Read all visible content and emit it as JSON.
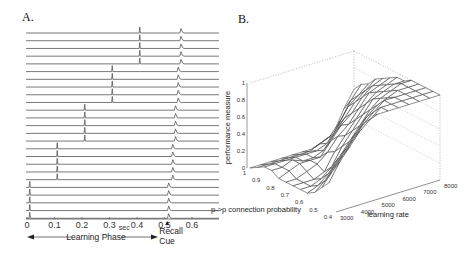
{
  "panels": {
    "a": {
      "label": "A."
    },
    "b": {
      "label": "B."
    }
  },
  "chart_data": [
    {
      "type": "line",
      "title": "A.",
      "description": "Spike raster traces: 25 neurons in 5 groups of 5; each group fires once during learning phase then again after recall cue",
      "xlabel": "sec",
      "xticks": [
        0,
        0.1,
        0.2,
        0.3,
        0.4,
        0.5,
        0.6
      ],
      "xtick_labels": [
        "0",
        "0.1",
        "0.2",
        "0.3",
        "0.4",
        "0.5",
        "0.6"
      ],
      "xlim": [
        0,
        0.7
      ],
      "annotations": {
        "learning_phase": "Learning Phase",
        "recall_cue_line1": "Recall",
        "recall_cue_line2": "Cue",
        "recall_cue_time": 0.51
      },
      "traces": [
        {
          "group": 5,
          "learn_spike": 0.41,
          "recall_spike": 0.56
        },
        {
          "group": 5,
          "learn_spike": 0.41,
          "recall_spike": 0.56
        },
        {
          "group": 5,
          "learn_spike": 0.41,
          "recall_spike": 0.56
        },
        {
          "group": 5,
          "learn_spike": 0.41,
          "recall_spike": 0.56
        },
        {
          "group": 5,
          "learn_spike": 0.41,
          "recall_spike": 0.56
        },
        {
          "group": 4,
          "learn_spike": 0.31,
          "recall_spike": 0.55
        },
        {
          "group": 4,
          "learn_spike": 0.31,
          "recall_spike": 0.55
        },
        {
          "group": 4,
          "learn_spike": 0.31,
          "recall_spike": 0.55
        },
        {
          "group": 4,
          "learn_spike": 0.31,
          "recall_spike": 0.55
        },
        {
          "group": 4,
          "learn_spike": 0.31,
          "recall_spike": 0.55
        },
        {
          "group": 3,
          "learn_spike": 0.21,
          "recall_spike": 0.54
        },
        {
          "group": 3,
          "learn_spike": 0.21,
          "recall_spike": 0.54
        },
        {
          "group": 3,
          "learn_spike": 0.21,
          "recall_spike": 0.54
        },
        {
          "group": 3,
          "learn_spike": 0.21,
          "recall_spike": 0.54
        },
        {
          "group": 3,
          "learn_spike": 0.21,
          "recall_spike": 0.54
        },
        {
          "group": 2,
          "learn_spike": 0.11,
          "recall_spike": 0.53
        },
        {
          "group": 2,
          "learn_spike": 0.11,
          "recall_spike": 0.53
        },
        {
          "group": 2,
          "learn_spike": 0.11,
          "recall_spike": 0.53
        },
        {
          "group": 2,
          "learn_spike": 0.11,
          "recall_spike": 0.53
        },
        {
          "group": 2,
          "learn_spike": 0.11,
          "recall_spike": 0.53
        },
        {
          "group": 1,
          "learn_spike": 0.01,
          "recall_spike": 0.515
        },
        {
          "group": 1,
          "learn_spike": 0.01,
          "recall_spike": 0.515
        },
        {
          "group": 1,
          "learn_spike": 0.01,
          "recall_spike": 0.515
        },
        {
          "group": 1,
          "learn_spike": 0.01,
          "recall_spike": 0.515
        },
        {
          "group": 1,
          "learn_spike": 0.01,
          "recall_spike": 0.515
        }
      ]
    },
    {
      "type": "surface",
      "title": "B.",
      "zlabel": "performance measure",
      "xlabel": "learning rate",
      "ylabel": "p->p connection probability",
      "zticks": [
        0,
        0.2,
        0.4,
        0.6,
        0.8,
        1
      ],
      "ztick_labels": [
        "0",
        "0.2",
        "0.4",
        "0.6",
        "0.8",
        "1"
      ],
      "xticks": [
        3000,
        4000,
        5000,
        6000,
        7000,
        8000
      ],
      "xtick_labels": [
        "3000",
        "4000",
        "5000",
        "6000",
        "7000",
        "8000"
      ],
      "yticks": [
        1,
        0.9,
        0.8,
        0.7,
        0.6,
        0.5,
        0.4
      ],
      "ytick_labels": [
        "1",
        "0.9",
        "0.8",
        "0.7",
        "0.6",
        "0.5",
        "0.4"
      ],
      "zlim": [
        0,
        1
      ],
      "x_grid": [
        3000,
        3500,
        4000,
        4500,
        5000,
        5500,
        6000,
        6500,
        7000,
        7500,
        8000
      ],
      "y_grid": [
        1.0,
        0.95,
        0.9,
        0.85,
        0.8,
        0.75,
        0.7,
        0.65,
        0.6,
        0.55,
        0.5,
        0.45,
        0.4
      ],
      "z_values_note": "rows follow y_grid (p from 1.0 down to 0.4), columns follow x_grid (learning rate 3000..8000); high performance at high learning rate / low p",
      "z": [
        [
          0.0,
          0.0,
          0.0,
          0.0,
          0.0,
          0.0,
          0.0,
          0.05,
          0.1,
          0.35,
          0.55
        ],
        [
          0.05,
          0.05,
          0.05,
          0.05,
          0.05,
          0.05,
          0.1,
          0.15,
          0.3,
          0.5,
          0.65
        ],
        [
          0.1,
          0.1,
          0.1,
          0.1,
          0.1,
          0.1,
          0.15,
          0.3,
          0.5,
          0.6,
          0.7
        ],
        [
          0.1,
          0.1,
          0.15,
          0.1,
          0.1,
          0.15,
          0.3,
          0.45,
          0.6,
          0.7,
          0.8
        ],
        [
          0.05,
          0.1,
          0.15,
          0.15,
          0.15,
          0.3,
          0.45,
          0.55,
          0.7,
          0.8,
          0.85
        ],
        [
          0.05,
          0.05,
          0.1,
          0.15,
          0.25,
          0.4,
          0.5,
          0.65,
          0.8,
          0.85,
          0.9
        ],
        [
          0.05,
          0.05,
          0.05,
          0.1,
          0.3,
          0.45,
          0.6,
          0.75,
          0.85,
          0.9,
          0.95
        ],
        [
          0.05,
          0.05,
          0.1,
          0.2,
          0.4,
          0.55,
          0.7,
          0.85,
          0.9,
          0.95,
          0.95
        ],
        [
          0.05,
          0.1,
          0.2,
          0.35,
          0.5,
          0.65,
          0.8,
          0.9,
          0.95,
          1.0,
          1.0
        ],
        [
          0.1,
          0.2,
          0.35,
          0.5,
          0.65,
          0.8,
          0.9,
          0.95,
          1.0,
          1.0,
          1.0
        ],
        [
          0.2,
          0.35,
          0.5,
          0.65,
          0.8,
          0.9,
          1.0,
          1.0,
          1.0,
          1.0,
          1.0
        ],
        [
          0.3,
          0.5,
          0.65,
          0.8,
          0.9,
          1.0,
          1.0,
          1.0,
          1.0,
          1.0,
          1.0
        ],
        [
          1.0,
          1.0,
          1.0,
          1.0,
          1.0,
          1.0,
          1.0,
          1.0,
          1.0,
          1.0,
          1.0
        ]
      ]
    }
  ]
}
